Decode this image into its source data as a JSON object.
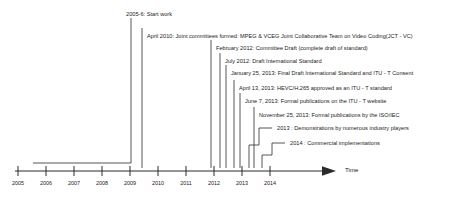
{
  "figure": {
    "kind": "timeline-diagram",
    "background_color": "#ffffff",
    "line_color": "#2b2b2b",
    "text_color": "#1b1b1b"
  },
  "axis": {
    "title": "Time",
    "arrow_icon": "right-arrow-icon",
    "ticks": [
      {
        "label": "2005",
        "x": 18
      },
      {
        "label": "2006",
        "x": 46
      },
      {
        "label": "2007",
        "x": 74
      },
      {
        "label": "2008",
        "x": 102
      },
      {
        "label": "2009",
        "x": 130
      },
      {
        "label": "2010",
        "x": 158
      },
      {
        "label": "2011",
        "x": 186
      },
      {
        "label": "2012",
        "x": 214
      },
      {
        "label": "2013",
        "x": 242
      },
      {
        "label": "2014",
        "x": 270
      }
    ]
  },
  "events": [
    {
      "id": "start-work",
      "text": "2005-6: Start work",
      "label_x": 126,
      "label_y": 11,
      "connector": "elbow-left",
      "stem_x": 131,
      "stem_top": 18,
      "elbow_y": 163,
      "elbow_x": 33
    },
    {
      "id": "jct-vc-formed",
      "text": "April 2010: Joint committees formed: MPEG & VCEG Joint Collaborative Team on Video Coding(JCT - VC)",
      "label_x": 147,
      "label_y": 33,
      "connector": "straight",
      "stem_x": 142,
      "stem_top": 28,
      "stem_bottom": 168
    },
    {
      "id": "committee-draft",
      "text": "February 2012: Committee Draft (complete draft of standard)",
      "label_x": 216,
      "label_y": 45,
      "connector": "straight",
      "stem_x": 211,
      "stem_top": 40,
      "stem_bottom": 168
    },
    {
      "id": "draft-international-standard",
      "text": "July 2012: Draft International Standard",
      "label_x": 225,
      "label_y": 58,
      "connector": "straight",
      "stem_x": 220,
      "stem_top": 53,
      "stem_bottom": 168
    },
    {
      "id": "final-draft-itu-t-consent",
      "text": "January 25, 2013: Final Draft International Standard and ITU - T Consent",
      "label_x": 231,
      "label_y": 70,
      "connector": "straight",
      "stem_x": 226,
      "stem_top": 65,
      "stem_bottom": 168
    },
    {
      "id": "hevc-h265-approved",
      "text": "April 13, 2013: HEVC/H.265 approved as an ITU - T standard",
      "label_x": 239,
      "label_y": 85,
      "connector": "straight",
      "stem_x": 234,
      "stem_top": 80,
      "stem_bottom": 168
    },
    {
      "id": "formal-publications-itu-t",
      "text": "June 7, 2013: Formal publications on the ITU - T website",
      "label_x": 245,
      "label_y": 98,
      "connector": "straight",
      "stem_x": 240,
      "stem_top": 93,
      "stem_bottom": 168
    },
    {
      "id": "formal-publications-iso-iec",
      "text": "November 25, 2013: Formal publications by the ISO/IEC",
      "label_x": 259,
      "label_y": 112,
      "connector": "straight",
      "stem_x": 254,
      "stem_top": 107,
      "stem_bottom": 168
    },
    {
      "id": "demonstrations-industry",
      "text": "2013 : Demonstrations by numerous industry players",
      "label_x": 277,
      "label_y": 125,
      "connector": "step",
      "step_start_x": 272,
      "step_top_y": 128,
      "step_mid_y": 145,
      "step_end_x": 259,
      "step_bottom_y": 168
    },
    {
      "id": "commercial-implementations",
      "text": "2014 : Commercial implementations",
      "label_x": 290,
      "label_y": 140,
      "connector": "step",
      "step_start_x": 285,
      "step_top_y": 143,
      "step_mid_y": 155,
      "step_end_x": 272,
      "step_bottom_y": 168
    }
  ]
}
